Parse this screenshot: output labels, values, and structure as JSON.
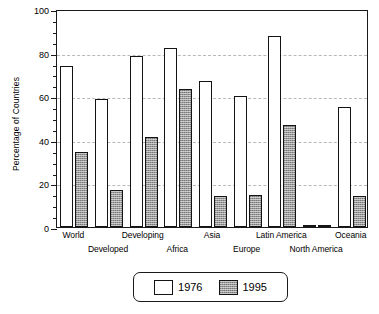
{
  "chart_data": {
    "type": "bar",
    "title": "",
    "xlabel": "",
    "ylabel": "Percentage of Countries",
    "ylim": [
      0,
      100
    ],
    "ytick_labels": [
      "0",
      "20",
      "40",
      "60",
      "80",
      "100"
    ],
    "ytick_values": [
      0,
      20,
      40,
      60,
      80,
      100
    ],
    "minor_tick_step": 5,
    "gridlines": [
      20,
      40,
      60,
      80
    ],
    "grid": true,
    "legend_position": "below-center",
    "categories": [
      "World",
      "Developed",
      "Developing",
      "Africa",
      "Asia",
      "Europe",
      "Latin America",
      "North America",
      "Oceania"
    ],
    "series": [
      {
        "name": "1976",
        "values": [
          74,
          58.5,
          78.5,
          82,
          67,
          60,
          87.5,
          0,
          55
        ]
      },
      {
        "name": "1995",
        "values": [
          34.5,
          17,
          41.5,
          63.5,
          14,
          14.5,
          47,
          0,
          14
        ]
      }
    ]
  },
  "legend": {
    "entries": [
      {
        "label": "1976",
        "swatch": "hollow-white-bar"
      },
      {
        "label": "1995",
        "swatch": "gray-hatched-bar"
      }
    ]
  },
  "colors": {
    "series_1976": "#ffffff",
    "series_1995": "#9a9a9a",
    "axis": "#1a1a1a",
    "gridline": "#b8b8b8",
    "background": "#ffffff"
  }
}
